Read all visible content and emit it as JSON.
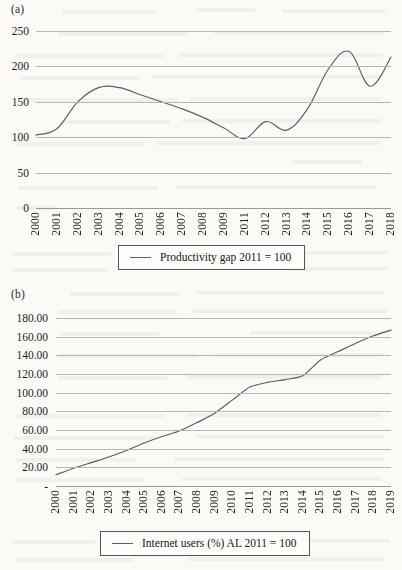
{
  "page": {
    "background_color": "#fbfaf7",
    "line_color": "#5c5c66",
    "grid_color": "#b6b6b6"
  },
  "panels": [
    {
      "id": "a",
      "label": "(a)",
      "legend_label": "Productivity gap 2011 = 100",
      "legend_icon": "line-swatch-icon"
    },
    {
      "id": "b",
      "label": "(b)",
      "legend_label": "Internet users (%) AL 2011 = 100",
      "legend_icon": "line-swatch-icon"
    }
  ],
  "chart_data": [
    {
      "type": "line",
      "title": "(a)",
      "xlabel": "",
      "ylabel": "",
      "ylim": [
        0,
        250
      ],
      "yticks": [
        0,
        50,
        100,
        150,
        200,
        250
      ],
      "ytick_labels": [
        "0",
        "50",
        "100",
        "150",
        "200",
        "250"
      ],
      "grid": true,
      "legend_position": "below-plot-center",
      "categories": [
        "2000",
        "2001",
        "2002",
        "2003",
        "2004",
        "2005",
        "2006",
        "2007",
        "2008",
        "2009",
        "2011",
        "2012",
        "2013",
        "2014",
        "2015",
        "2016",
        "2017",
        "2018"
      ],
      "series": [
        {
          "name": "Productivity gap 2011 = 100",
          "values": [
            103,
            112,
            150,
            170,
            170,
            160,
            150,
            140,
            128,
            113,
            98,
            122,
            110,
            140,
            196,
            221,
            172,
            213
          ]
        }
      ]
    },
    {
      "type": "line",
      "title": "(b)",
      "xlabel": "",
      "ylabel": "",
      "ylim": [
        0,
        180
      ],
      "yticks": [
        0,
        20,
        40,
        60,
        80,
        100,
        120,
        140,
        160,
        180
      ],
      "ytick_labels": [
        "-",
        "20.00",
        "40.00",
        "60.00",
        "80.00",
        "100.00",
        "120.00",
        "140.00",
        "160.00",
        "180.00"
      ],
      "grid": true,
      "legend_position": "below-plot-center",
      "categories": [
        "2000",
        "2001",
        "2002",
        "2003",
        "2004",
        "2005",
        "2006",
        "2007",
        "2008",
        "2009",
        "2010",
        "2011",
        "2012",
        "2013",
        "2014",
        "2015",
        "2016",
        "2017",
        "2018",
        "2019"
      ],
      "series": [
        {
          "name": "Internet users (%) AL 2011 = 100",
          "values": [
            12,
            19,
            25,
            31,
            38,
            46,
            53,
            59,
            68,
            78,
            92,
            106,
            111,
            114,
            118,
            135,
            144,
            153,
            161,
            167
          ]
        }
      ]
    }
  ]
}
